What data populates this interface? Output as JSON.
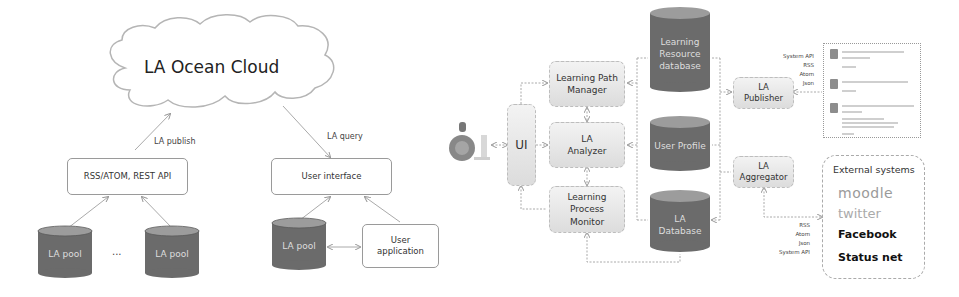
{
  "left_diagram": {
    "cloud": {
      "title": "LA  Ocean Cloud"
    },
    "edge_labels": {
      "publish": "LA publish",
      "query": "LA query"
    },
    "api_box": {
      "label": "RSS/ATOM, REST API"
    },
    "ui_box": {
      "label": "User interface"
    },
    "pools": [
      {
        "label": "LA pool"
      },
      {
        "label": "LA pool"
      },
      {
        "label": "LA pool"
      }
    ],
    "ellipsis": "...",
    "user_app": {
      "label_line1": "User",
      "label_line2": "application"
    }
  },
  "right_diagram": {
    "ui": {
      "label": "UI"
    },
    "modules": [
      {
        "line1": "Learning Path",
        "line2": "Manager"
      },
      {
        "line1": "LA",
        "line2": "Analyzer"
      },
      {
        "line1": "Learning",
        "line2": "Process",
        "line3": "Monitor"
      }
    ],
    "databases": [
      {
        "line1": "Learning",
        "line2": "Resource",
        "line3": "database"
      },
      {
        "line1": "User Profile"
      },
      {
        "line1": "LA",
        "line2": "Database"
      }
    ],
    "publisher": {
      "line1": "LA",
      "line2": "Publisher"
    },
    "aggregator": {
      "line1": "LA",
      "line2": "Aggregator"
    },
    "publisher_formats": [
      "System  API",
      "RSS",
      "Atom",
      "Json"
    ],
    "aggregator_formats": [
      "RSS",
      "Atom",
      "Json",
      "System  API"
    ],
    "external_systems": {
      "title": "External systems",
      "items": [
        {
          "label": "moodle",
          "color": "#9a9a9a"
        },
        {
          "label": "twitter",
          "color": "#aaaaaa"
        },
        {
          "label": "Facebook",
          "color": "#111111"
        },
        {
          "label": "Status net",
          "color": "#111111"
        }
      ]
    }
  },
  "colors": {
    "cylinder_body": "#6b6b6b",
    "cylinder_top": "#9c9c9c",
    "module_fill": "#e6e6e6",
    "line": "#a8a8a8"
  }
}
